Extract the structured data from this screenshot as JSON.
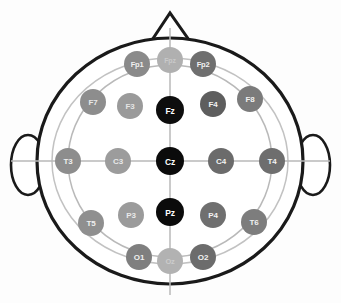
{
  "figure": {
    "view": "top-down head with nose at top and ears at sides",
    "background_color": "#fdfdfd",
    "outline_color": "#1a1a1a",
    "guide_color": "#b9b9b9"
  },
  "anatomy": {
    "head_label": "head-outline",
    "nose_label": "nose-marker",
    "left_ear_label": "left-ear",
    "right_ear_label": "right-ear"
  },
  "legend": {
    "midline_color": "#0d0d0d",
    "dark_gray_color": "#5e5e5e",
    "mid_gray_color": "#8e8e8e",
    "light_gray_color": "#b5b5b5"
  },
  "chart_data": {
    "type": "scatter",
    "xlabel": "",
    "ylabel": "",
    "xlim": [
      0,
      341
    ],
    "ylim": [
      0,
      303
    ],
    "grid": false,
    "legend_position": "none",
    "rows": [
      {
        "name": "frontopolar",
        "labels": [
          "Fp1",
          "Fpz",
          "Fp2"
        ]
      },
      {
        "name": "frontal",
        "labels": [
          "F7",
          "F3",
          "Fz",
          "F4",
          "F8"
        ]
      },
      {
        "name": "central",
        "labels": [
          "T3",
          "C3",
          "Cz",
          "C4",
          "T4"
        ]
      },
      {
        "name": "parietal",
        "labels": [
          "T5",
          "P3",
          "Pz",
          "P4",
          "T6"
        ]
      },
      {
        "name": "occipital",
        "labels": [
          "O1",
          "Oz",
          "O2"
        ]
      }
    ],
    "electrodes": [
      {
        "label": "Fp1",
        "x": 137,
        "y": 64,
        "r": 13,
        "fill": "#8a8a8a",
        "text": "#f0f0f0",
        "font": 7.5
      },
      {
        "label": "Fpz",
        "x": 170,
        "y": 60,
        "r": 13,
        "fill": "#b0b0b0",
        "text": "#c9c9c9",
        "font": 7.0
      },
      {
        "label": "Fp2",
        "x": 203,
        "y": 64,
        "r": 13,
        "fill": "#6f6f6f",
        "text": "#f2f2f2",
        "font": 7.5
      },
      {
        "label": "F7",
        "x": 93,
        "y": 102,
        "r": 13,
        "fill": "#8d8d8d",
        "text": "#e8e8e8",
        "font": 8.0
      },
      {
        "label": "F3",
        "x": 130,
        "y": 106,
        "r": 13,
        "fill": "#9a9a9a",
        "text": "#e4e4e4",
        "font": 8.0
      },
      {
        "label": "Fz",
        "x": 170,
        "y": 110,
        "r": 14,
        "fill": "#0d0d0d",
        "text": "#ffffff",
        "font": 8.5
      },
      {
        "label": "F4",
        "x": 213,
        "y": 104,
        "r": 13,
        "fill": "#5e5e5e",
        "text": "#f2f2f2",
        "font": 8.0
      },
      {
        "label": "F8",
        "x": 250,
        "y": 99,
        "r": 13,
        "fill": "#7b7b7b",
        "text": "#f0f0f0",
        "font": 8.0
      },
      {
        "label": "T3",
        "x": 68,
        "y": 161,
        "r": 13,
        "fill": "#8d8d8d",
        "text": "#efefef",
        "font": 8.0
      },
      {
        "label": "C3",
        "x": 118,
        "y": 161,
        "r": 13,
        "fill": "#9c9c9c",
        "text": "#e9e9e9",
        "font": 8.0
      },
      {
        "label": "Cz",
        "x": 170,
        "y": 161,
        "r": 14,
        "fill": "#0b0b0b",
        "text": "#ffffff",
        "font": 8.5
      },
      {
        "label": "C4",
        "x": 221,
        "y": 161,
        "r": 13,
        "fill": "#6b6b6b",
        "text": "#f2f2f2",
        "font": 8.0
      },
      {
        "label": "T4",
        "x": 272,
        "y": 161,
        "r": 13,
        "fill": "#6e6e6e",
        "text": "#f2f2f2",
        "font": 8.0
      },
      {
        "label": "T5",
        "x": 91,
        "y": 223,
        "r": 13,
        "fill": "#8f8f8f",
        "text": "#efefef",
        "font": 8.0
      },
      {
        "label": "P3",
        "x": 131,
        "y": 215,
        "r": 13,
        "fill": "#9b9b9b",
        "text": "#e9e9e9",
        "font": 8.0
      },
      {
        "label": "Pz",
        "x": 170,
        "y": 212,
        "r": 14,
        "fill": "#0b0b0b",
        "text": "#ffffff",
        "font": 8.5
      },
      {
        "label": "P4",
        "x": 213,
        "y": 215,
        "r": 13,
        "fill": "#6f6f6f",
        "text": "#f2f2f2",
        "font": 8.0
      },
      {
        "label": "T6",
        "x": 254,
        "y": 222,
        "r": 13,
        "fill": "#7d7d7d",
        "text": "#f0f0f0",
        "font": 8.0
      },
      {
        "label": "O1",
        "x": 139,
        "y": 257,
        "r": 13,
        "fill": "#7f7f7f",
        "text": "#f0f0f0",
        "font": 8.0
      },
      {
        "label": "Oz",
        "x": 170,
        "y": 261,
        "r": 13,
        "fill": "#b2b2b2",
        "text": "#cccccc",
        "font": 7.5
      },
      {
        "label": "O2",
        "x": 203,
        "y": 257,
        "r": 13,
        "fill": "#6c6c6c",
        "text": "#f2f2f2",
        "font": 8.0
      }
    ]
  }
}
